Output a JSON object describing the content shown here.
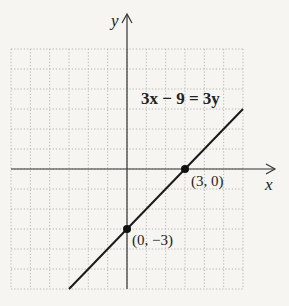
{
  "chart_data": {
    "type": "line",
    "title": "",
    "xlabel": "x",
    "ylabel": "y",
    "xlim": [
      -6,
      6
    ],
    "ylim": [
      -6,
      6
    ],
    "grid": true,
    "grid_style": "dotted",
    "series": [
      {
        "name": "3x − 9 = 3y",
        "equation": "3x − 9 = 3y",
        "slope": 1,
        "intercept": -3,
        "x": [
          -3,
          6
        ],
        "y": [
          -6,
          3
        ]
      }
    ],
    "points": [
      {
        "x": 3,
        "y": 0,
        "label": "(3, 0)"
      },
      {
        "x": 0,
        "y": -3,
        "label": "(0, −3)"
      }
    ],
    "annotations": [
      "3x − 9 = 3y",
      "(3, 0)",
      "(0, −3)"
    ]
  },
  "labels": {
    "x_axis": "x",
    "y_axis": "y",
    "equation": "3x − 9 = 3y",
    "point_x_intercept": "(3, 0)",
    "point_y_intercept": "(0, −3)"
  },
  "colors": {
    "background": "#f6f5f1",
    "grid": "#b5b5b0",
    "axis": "#333333",
    "line": "#1a1a1a"
  }
}
